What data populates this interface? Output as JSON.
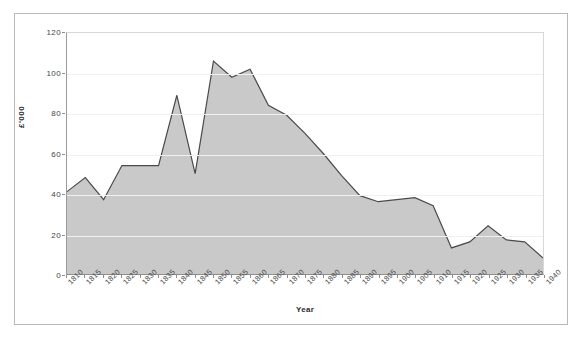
{
  "chart_data": {
    "type": "area",
    "title": "",
    "xlabel": "Year",
    "ylabel": "£'000",
    "x": [
      1810,
      1815,
      1820,
      1825,
      1830,
      1835,
      1840,
      1845,
      1850,
      1855,
      1860,
      1865,
      1870,
      1875,
      1880,
      1885,
      1890,
      1895,
      1900,
      1905,
      1910,
      1915,
      1920,
      1925,
      1930,
      1935,
      1940
    ],
    "categories": [
      "1810",
      "1815",
      "1820",
      "1825",
      "1830",
      "1835",
      "1840",
      "1845",
      "1850",
      "1855",
      "1860",
      "1865",
      "1870",
      "1875",
      "1880",
      "1885",
      "1890",
      "1895",
      "1900",
      "1905",
      "1910",
      "1915",
      "1920",
      "1925",
      "1930",
      "1935",
      "1940"
    ],
    "values": [
      41,
      48,
      37,
      54,
      54,
      54,
      89,
      50,
      106,
      98,
      102,
      84,
      79,
      70,
      60,
      49,
      39,
      36,
      37,
      38,
      34,
      13,
      16,
      24,
      17,
      16,
      8
    ],
    "ylim": [
      0,
      120
    ],
    "yticks": [
      0,
      20,
      40,
      60,
      80,
      100,
      120
    ],
    "ytick_labels": [
      "0",
      "20",
      "40",
      "60",
      "80",
      "100",
      "120"
    ],
    "grid": true,
    "legend": false,
    "series_fill_color": "#c9c9c9",
    "series_line_color": "#4a4a4a",
    "plot_background": "#ffffff",
    "frame_color": "#b9b9b9"
  }
}
